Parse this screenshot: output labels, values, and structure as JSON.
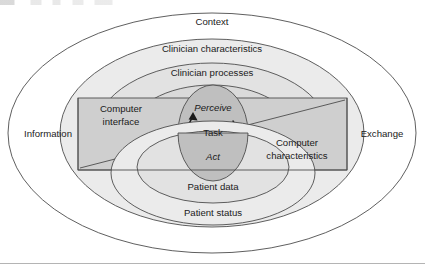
{
  "figure": {
    "title_fragment": "",
    "colors": {
      "outline": "#4d4d4d",
      "band_fill_outer": "#ffffff",
      "band_fill_clinician_characteristics": "#ebebeb",
      "band_fill_clinician_processes": "#e2e2e2",
      "band_fill_patient_data": "#e2e2e2",
      "band_fill_patient_status": "#ebebeb",
      "core_fill": "#bfbfbf",
      "rect_fill": "#cfcfcf",
      "text": "#1a1a1a",
      "rule": "#b4b4b4"
    },
    "outer_ellipse": {
      "label": "Context"
    },
    "side_labels": {
      "left": "Information",
      "right": "Exchange"
    },
    "upper_bands": [
      {
        "label": "Clinician characteristics"
      },
      {
        "label": "Clinician processes"
      }
    ],
    "lower_bands": [
      {
        "label": "Patient data"
      },
      {
        "label": "Patient status"
      }
    ],
    "rectangle": {
      "left_label_line1": "Computer",
      "left_label_line2": "interface",
      "right_label_line1": "Computer",
      "right_label_line2": "characteristics"
    },
    "core": {
      "top_label": "Perceive",
      "middle_label": "Task",
      "bottom_label": "Act"
    }
  }
}
